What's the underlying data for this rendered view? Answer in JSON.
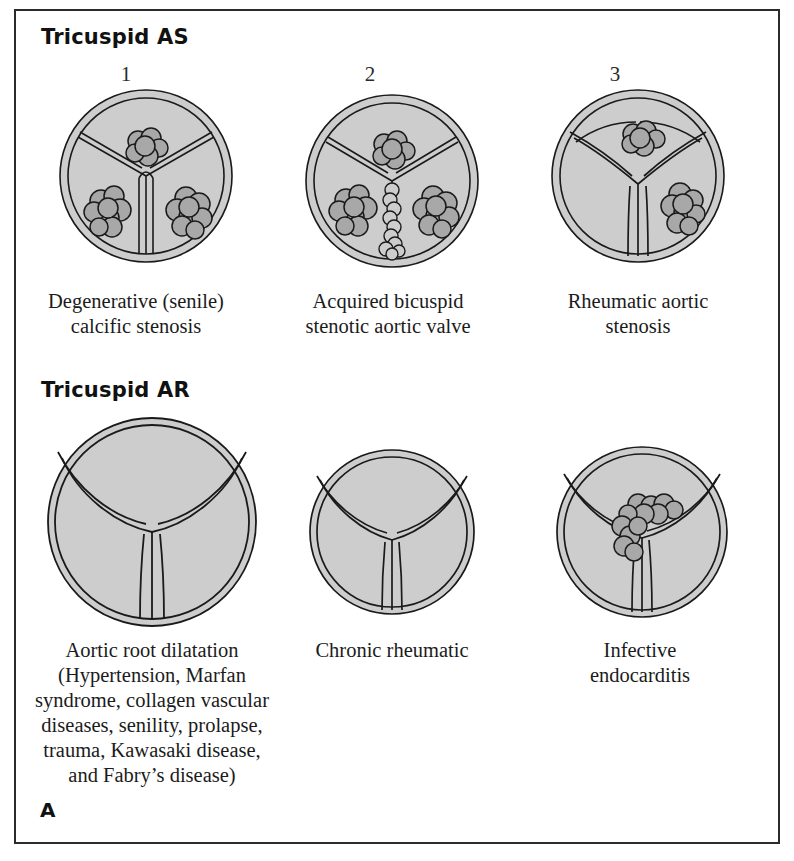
{
  "panel": {
    "label": "A"
  },
  "sections": [
    {
      "id": "as",
      "title": "Tricuspid AS"
    },
    {
      "id": "ar",
      "title": "Tricuspid AR"
    }
  ],
  "numbers": [
    "1",
    "2",
    "3"
  ],
  "figures_as": [
    {
      "number": "1",
      "caption_line1": "Degenerative (senile)",
      "caption_line2": "calcific stenosis"
    },
    {
      "number": "2",
      "caption_line1": "Acquired bicuspid",
      "caption_line2": "stenotic aortic valve"
    },
    {
      "number": "3",
      "caption_line1": "Rheumatic aortic",
      "caption_line2": "stenosis"
    }
  ],
  "figures_ar": [
    {
      "caption_line1": "Aortic root dilatation",
      "detail_lines": [
        "(Hypertension, Marfan",
        "syndrome, collagen vascular",
        "diseases, senility, prolapse,",
        "trauma, Kawasaki disease,",
        "and Fabry’s disease)"
      ]
    },
    {
      "caption_line1": "Chronic rheumatic",
      "detail_lines": []
    },
    {
      "caption_line1": "Infective",
      "caption_line2": "endocarditis",
      "detail_lines": []
    }
  ],
  "colors": {
    "border": "#2b2b2b",
    "leaflet_fill": "#cdcdcd",
    "nodule_fill": "#a8a8a8",
    "outline": "#1a1a1a",
    "background": "#ffffff"
  }
}
